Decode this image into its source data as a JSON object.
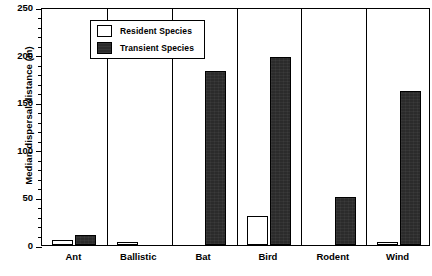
{
  "chart_data": {
    "type": "bar",
    "title": "",
    "xlabel": "",
    "ylabel": "Median dispersal distance  (m)",
    "ylim": [
      0,
      250
    ],
    "ytick_step": 50,
    "yminor_step": 10,
    "grid": false,
    "legend_position": "top-left",
    "categories": [
      "Ant",
      "Ballistic",
      "Bat",
      "Bird",
      "Rodent",
      "Wind"
    ],
    "series": [
      {
        "name": "Resident Species",
        "color": "#ffffff",
        "values": [
          5,
          3,
          0,
          30,
          0,
          3
        ]
      },
      {
        "name": "Transient Species",
        "color": "#2b2b2b",
        "values": [
          10,
          0,
          183,
          198,
          50,
          162
        ]
      }
    ],
    "ytick_labels": [
      "0",
      "50",
      "100",
      "150",
      "200",
      "250"
    ]
  },
  "legend": {
    "items": [
      {
        "label": "Resident Species",
        "swatch": "white-square-icon"
      },
      {
        "label": "Transient Species",
        "swatch": "black-square-icon"
      }
    ]
  }
}
